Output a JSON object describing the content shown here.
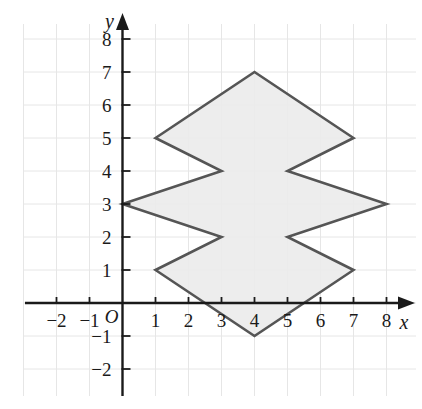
{
  "figure": {
    "type": "coordinate-plane-polygon",
    "background_color": "#ffffff",
    "grid": {
      "visible": true,
      "color": "#e6e6e6",
      "spacing_units": 1,
      "x_range": [
        -3,
        9
      ],
      "y_range": [
        -3,
        9
      ]
    },
    "axes": {
      "x_label": "x",
      "y_label": "y",
      "origin_label": "O",
      "color": "#1a1a1a",
      "arrowheads": [
        "x-positive",
        "y-positive"
      ],
      "x_ticks": [
        -2,
        -1,
        1,
        2,
        3,
        4,
        5,
        6,
        7,
        8
      ],
      "y_ticks": [
        -2,
        -1,
        1,
        2,
        3,
        4,
        5,
        6,
        7,
        8
      ],
      "x_tick_labels": [
        "-2",
        "-1",
        "1",
        "2",
        "3",
        "4",
        "5",
        "6",
        "7",
        "8"
      ],
      "y_tick_labels": [
        "-2",
        "-1",
        "1",
        "2",
        "3",
        "4",
        "5",
        "6",
        "7",
        "8"
      ]
    },
    "shape": {
      "name": "shaded-zigzag-polygon",
      "fill_color": "#ebebeb",
      "stroke_color": "#555555",
      "stroke_width": 2.6,
      "closed": true,
      "vertex_count": 12,
      "vertices": [
        {
          "x": 4,
          "y": 7
        },
        {
          "x": 7,
          "y": 5
        },
        {
          "x": 5,
          "y": 4
        },
        {
          "x": 8,
          "y": 3
        },
        {
          "x": 5,
          "y": 2
        },
        {
          "x": 7,
          "y": 1
        },
        {
          "x": 4,
          "y": -1
        },
        {
          "x": 1,
          "y": 1
        },
        {
          "x": 3,
          "y": 2
        },
        {
          "x": 0,
          "y": 3
        },
        {
          "x": 3,
          "y": 4
        },
        {
          "x": 1,
          "y": 5
        }
      ]
    }
  },
  "chart_data": {
    "type": "scatter",
    "title": "",
    "xlabel": "x",
    "ylabel": "y",
    "xlim": [
      -3,
      9
    ],
    "ylim": [
      -3,
      9
    ],
    "grid": true,
    "legend": "none",
    "series": [
      {
        "name": "shaded-zigzag-polygon",
        "closed_path": true,
        "x": [
          4,
          7,
          5,
          8,
          5,
          7,
          4,
          1,
          3,
          0,
          3,
          1
        ],
        "y": [
          7,
          5,
          4,
          3,
          2,
          1,
          -1,
          1,
          2,
          3,
          4,
          5
        ]
      }
    ],
    "xticks": [
      -2,
      -1,
      1,
      2,
      3,
      4,
      5,
      6,
      7,
      8
    ],
    "yticks": [
      -2,
      -1,
      1,
      2,
      3,
      4,
      5,
      6,
      7,
      8
    ]
  }
}
